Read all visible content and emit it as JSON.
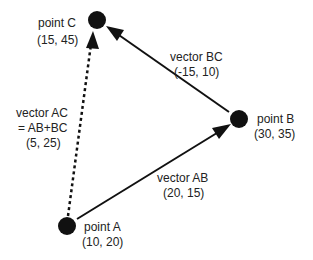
{
  "diagram": {
    "points": {
      "A": {
        "name": "point A",
        "coords": "(10, 20)"
      },
      "B": {
        "name": "point B",
        "coords": "(30, 35)"
      },
      "C": {
        "name": "point C",
        "coords": "(15, 45)"
      }
    },
    "vectors": {
      "AB": {
        "name": "vector AB",
        "value": "(20, 15)",
        "style": "solid"
      },
      "BC": {
        "name": "vector BC",
        "value": "(-15, 10)",
        "style": "solid"
      },
      "AC": {
        "name": "vector AC",
        "formula": "= AB+BC",
        "value": "(5, 25)",
        "style": "dotted"
      }
    },
    "colors": {
      "ink": "#111111",
      "text": "#222222",
      "background": "#ffffff"
    }
  }
}
